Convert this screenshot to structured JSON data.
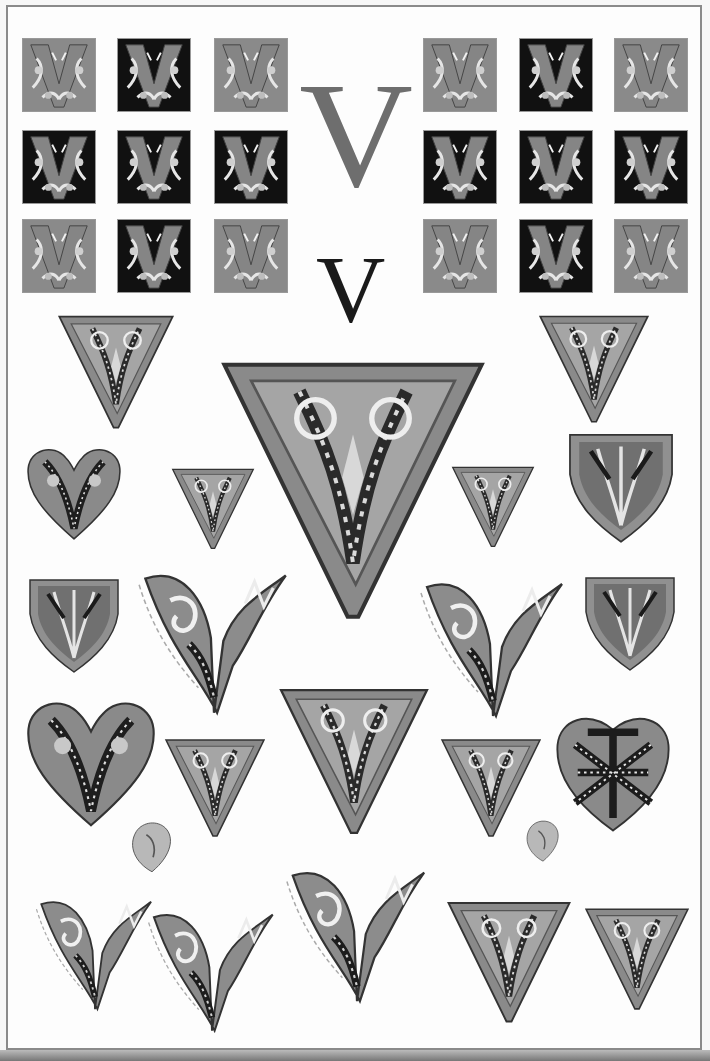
{
  "plate": {
    "subject": "Ornamental illuminated initials — letter V",
    "large_letter": "V",
    "small_letter": "V",
    "colors": {
      "mid_gray": "#7a7a7a",
      "dark": "#111111",
      "light_gray": "#a8a8a8",
      "highlight": "#e8e8e8",
      "outline": "#555555"
    }
  },
  "tiles_left": [
    {
      "bg": "light"
    },
    {
      "bg": "dark"
    },
    {
      "bg": "light"
    },
    {
      "bg": "dark"
    },
    {
      "bg": "dark"
    },
    {
      "bg": "dark"
    },
    {
      "bg": "light"
    },
    {
      "bg": "dark"
    },
    {
      "bg": "light"
    }
  ],
  "tiles_right": [
    {
      "bg": "light"
    },
    {
      "bg": "dark"
    },
    {
      "bg": "light"
    },
    {
      "bg": "dark"
    },
    {
      "bg": "dark"
    },
    {
      "bg": "dark"
    },
    {
      "bg": "light"
    },
    {
      "bg": "dark"
    },
    {
      "bg": "light"
    }
  ],
  "ornament_count": 26
}
